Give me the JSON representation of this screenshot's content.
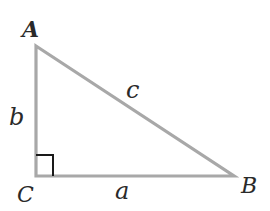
{
  "diagram": {
    "type": "right-triangle",
    "vertices": {
      "A": {
        "label": "A",
        "x": 36,
        "y": 46
      },
      "B": {
        "label": "B",
        "x": 234,
        "y": 176
      },
      "C": {
        "label": "C",
        "x": 36,
        "y": 176
      }
    },
    "sides": {
      "a": {
        "label": "a",
        "between": [
          "C",
          "B"
        ]
      },
      "b": {
        "label": "b",
        "between": [
          "A",
          "C"
        ]
      },
      "c": {
        "label": "c",
        "between": [
          "A",
          "B"
        ]
      }
    },
    "right_angle_at": "C",
    "colors": {
      "line": "#a8a8a8",
      "right_angle_marker": "#1a1a1a",
      "label": "#2a2a2a"
    }
  }
}
